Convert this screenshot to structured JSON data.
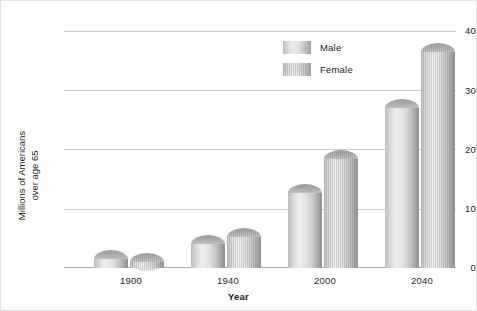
{
  "chart_data": {
    "type": "bar",
    "title": "",
    "subtitle": "",
    "xlabel": "Year",
    "ylabel": "Millions of Americans\nover age 65",
    "categories": [
      "1900",
      "1940",
      "2000",
      "2040"
    ],
    "series": [
      {
        "name": "Male",
        "values": [
          3.1,
          5.5,
          14.2,
          28.5
        ]
      },
      {
        "name": "Female",
        "values": [
          2.6,
          6.8,
          20.0,
          38.0
        ]
      }
    ],
    "ylim": [
      0,
      40
    ],
    "yticks": [
      0,
      10,
      20,
      30,
      40
    ],
    "ytick_labels": [
      "0",
      "10",
      "20",
      "30",
      "40"
    ],
    "grid": true,
    "grid_axis": "y",
    "legend_position": "top-right",
    "bar_style": "3d-cylinder",
    "colors": {
      "male": "#d0d0d0",
      "female": "#d4d4d4",
      "gridline": "#c9c9c9",
      "axis": "#a8a8a8",
      "text": "#231f20",
      "background": "#ffffff",
      "border": "#e2e2e2"
    }
  },
  "axis": {
    "y": {
      "label_line1": "Millions of Americans",
      "label_line2": "over age 65",
      "ticks": [
        {
          "value": "40"
        },
        {
          "value": "30"
        },
        {
          "value": "20"
        },
        {
          "value": "10"
        },
        {
          "value": "0"
        }
      ]
    },
    "x": {
      "label": "Year",
      "ticks": [
        {
          "value": "1900"
        },
        {
          "value": "1940"
        },
        {
          "value": "2000"
        },
        {
          "value": "2040"
        }
      ]
    }
  },
  "legend": {
    "items": [
      {
        "label": "Male",
        "swatch": "male-swatch-icon"
      },
      {
        "label": "Female",
        "swatch": "female-swatch-icon"
      }
    ]
  }
}
